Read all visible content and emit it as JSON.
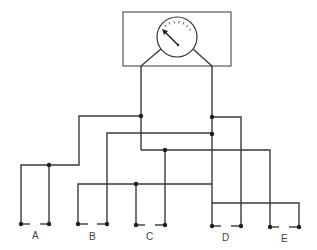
{
  "diagram": {
    "type": "wiring-diagram",
    "meter": {
      "name": "gauge",
      "center": [
        177,
        37
      ],
      "radius": 20,
      "ticks": 7
    },
    "terminal_labels": [
      {
        "id": "A",
        "label": "A",
        "x": 33,
        "y": 237
      },
      {
        "id": "B",
        "label": "B",
        "x": 90,
        "y": 238
      },
      {
        "id": "C",
        "label": "C",
        "x": 147,
        "y": 238
      },
      {
        "id": "D",
        "label": "D",
        "x": 222,
        "y": 239
      },
      {
        "id": "E",
        "label": "E",
        "x": 281,
        "y": 240
      }
    ],
    "colors": {
      "line": "#3a3a3a",
      "dot": "#1e1e1e",
      "background": "#ffffff"
    }
  }
}
